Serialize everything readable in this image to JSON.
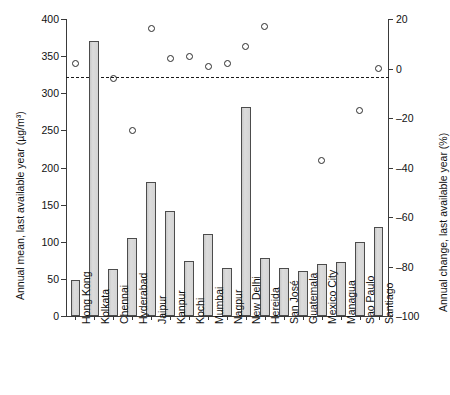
{
  "chart_data": {
    "type": "bar",
    "title": "",
    "subtitle": "",
    "xlabel": "",
    "ylabel": "Annual mean, last available year (µg/m³)",
    "y2label": "Annual change, last available year (%)",
    "categories": [
      "Hong Kong",
      "Kolkata",
      "Chennai",
      "Hyderabad",
      "Jaipur",
      "Kanpur",
      "Kochi",
      "Mumbai",
      "Nagpur",
      "New Delhi",
      "Hereida",
      "San José",
      "Guatemala",
      "Mexico City",
      "Managua",
      "Sao Paulo",
      "Santiago"
    ],
    "series": [
      {
        "name": "Annual mean, last available year (µg/m³)",
        "kind": "bar",
        "axis": "left",
        "values": [
          49,
          371,
          63,
          105,
          181,
          142,
          74,
          110,
          64,
          281,
          78,
          64,
          61,
          70,
          73,
          99,
          120
        ]
      },
      {
        "name": "Annual change, last available year (%)",
        "kind": "scatter",
        "axis": "right",
        "values": [
          2,
          null,
          -4,
          -25,
          16,
          4,
          5,
          1,
          2,
          9,
          17,
          null,
          null,
          -37,
          null,
          -17,
          0
        ]
      }
    ],
    "ylim": [
      0,
      400
    ],
    "yticks": [
      0,
      50,
      100,
      150,
      200,
      250,
      300,
      350,
      400
    ],
    "ytick_labels": [
      "0",
      "50",
      "100",
      "150",
      "200",
      "250",
      "300",
      "350",
      "400"
    ],
    "y2lim": [
      -100,
      20
    ],
    "y2ticks": [
      -100,
      -80,
      -60,
      -40,
      -20,
      0,
      20
    ],
    "y2tick_labels": [
      "–100",
      "–80",
      "–60",
      "–40",
      "–20",
      "0",
      "20"
    ],
    "grid": false,
    "legend": "none",
    "reference_line": {
      "axis": "right",
      "value": -3.5,
      "style": "dashed"
    },
    "colors": {
      "bar_fill": "#d2d2d2",
      "bar_edge": "#4c4c4c",
      "marker_edge": "#2b2b2b",
      "axis": "#3a3a3a",
      "text": "#111111",
      "background": "#ffffff"
    }
  }
}
